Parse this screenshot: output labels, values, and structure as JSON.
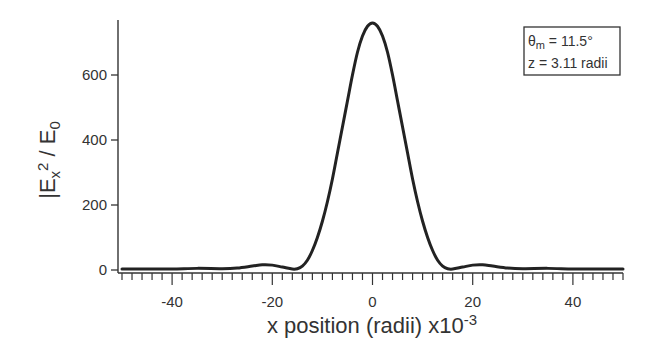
{
  "chart_data": {
    "type": "line",
    "title": "",
    "xlabel": "x position (radii) x10",
    "xlabel_exponent": "-3",
    "ylabel_parts": {
      "main": "|E",
      "sub1": "x",
      "sup": "2",
      "mid": " / E",
      "sub2": "0"
    },
    "xlim": [
      -50,
      50
    ],
    "ylim": [
      0,
      760
    ],
    "x_ticks": [
      -40,
      -20,
      0,
      20,
      40
    ],
    "x_tick_labels": [
      "-40",
      "-20",
      "0",
      "20",
      "40"
    ],
    "x_minor_step": 2,
    "y_ticks": [
      0,
      200,
      400,
      600
    ],
    "y_tick_labels": [
      "0",
      "200",
      "400",
      "600"
    ],
    "grid": false,
    "legend": null,
    "annotation": {
      "line1_main": "θ",
      "line1_sub": "m",
      "line1_rest": " = 11.5°",
      "line2": "z = 3.11 radii",
      "position": "top-right"
    },
    "series": [
      {
        "name": "|Ex|^2/E0",
        "color": "#222222",
        "x": [
          -50,
          -45,
          -40,
          -35,
          -30,
          -27,
          -24,
          -22,
          -20,
          -18,
          -16,
          -15,
          -14,
          -13,
          -12,
          -11,
          -10,
          -9,
          -8,
          -7,
          -6,
          -5,
          -4,
          -3,
          -2,
          -1,
          0,
          1,
          2,
          3,
          4,
          5,
          6,
          7,
          8,
          9,
          10,
          11,
          12,
          13,
          14,
          15,
          16,
          18,
          20,
          22,
          24,
          27,
          30,
          35,
          40,
          45,
          50
        ],
        "y": [
          3,
          3,
          3,
          5,
          4,
          6,
          12,
          16,
          15,
          9,
          3,
          4,
          12,
          30,
          60,
          100,
          150,
          210,
          280,
          360,
          440,
          520,
          600,
          670,
          720,
          750,
          760,
          750,
          720,
          670,
          600,
          520,
          440,
          360,
          280,
          210,
          150,
          100,
          60,
          30,
          12,
          4,
          3,
          9,
          15,
          16,
          12,
          6,
          4,
          5,
          3,
          3,
          3
        ]
      }
    ]
  }
}
